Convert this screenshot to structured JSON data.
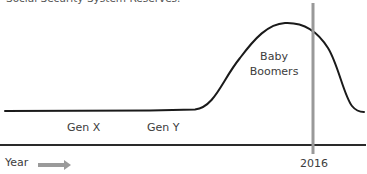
{
  "caption": "Social Security System Reserves.",
  "labels": {
    "gen_x": "Gen X",
    "gen_y": "Gen Y",
    "baby_boomers_line1": "Baby",
    "baby_boomers_line2": "Boomers",
    "year_marker": "2016",
    "x_axis": "Year"
  },
  "colors": {
    "curve": "#1a1a1a",
    "axis": "#2a2a2a",
    "marker_line": "#999999",
    "arrow": "#9a9a9a"
  },
  "diagram": {
    "type": "conceptual-curve",
    "regions": [
      "Gen X",
      "Gen Y",
      "Baby Boomers"
    ],
    "marker": "2016"
  }
}
